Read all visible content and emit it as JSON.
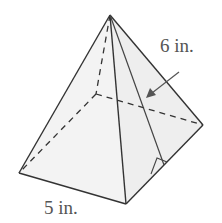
{
  "figure": {
    "type": "square pyramid",
    "labels": {
      "slant_height": "6 in.",
      "base_edge": "5 in."
    },
    "colors": {
      "face_fill": "#f2f2f2",
      "edge": "#333333",
      "label": "#555555"
    }
  }
}
